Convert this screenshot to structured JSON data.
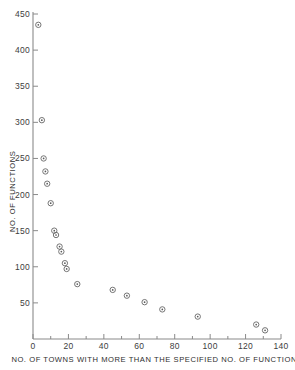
{
  "chart_data": {
    "type": "scatter",
    "title": "",
    "xlabel": "NO. OF TOWNS WITH MORE THAN THE SPECIFIED NO. OF FUNCTIONS",
    "ylabel": "NO. OF FUNCTIONS",
    "xlim": [
      0,
      140
    ],
    "ylim": [
      0,
      450
    ],
    "xticks": [
      0,
      20,
      40,
      60,
      80,
      100,
      120,
      140
    ],
    "yticks": [
      50,
      100,
      150,
      200,
      250,
      300,
      350,
      400,
      450
    ],
    "xticklabels": [
      "0",
      "20",
      "40",
      "60",
      "80",
      "100",
      "120",
      "140"
    ],
    "yticklabels": [
      "50",
      "100",
      "150",
      "200",
      "250",
      "300",
      "350",
      "400",
      "450"
    ],
    "xminorticks": [
      10,
      30,
      50,
      70,
      90,
      110,
      130
    ],
    "grid": false,
    "legend": null,
    "marker": "circle-with-center-dot",
    "marker_color": "#6e6e6e",
    "axis_color": "#8a8a8a",
    "spines": [
      "left",
      "bottom"
    ],
    "points": [
      {
        "x": 3,
        "y": 435
      },
      {
        "x": 5,
        "y": 303
      },
      {
        "x": 6,
        "y": 250
      },
      {
        "x": 7,
        "y": 232
      },
      {
        "x": 8,
        "y": 215
      },
      {
        "x": 10,
        "y": 188
      },
      {
        "x": 12,
        "y": 150
      },
      {
        "x": 13,
        "y": 144
      },
      {
        "x": 15,
        "y": 128
      },
      {
        "x": 16,
        "y": 121
      },
      {
        "x": 18,
        "y": 105
      },
      {
        "x": 19,
        "y": 97
      },
      {
        "x": 25,
        "y": 76
      },
      {
        "x": 45,
        "y": 68
      },
      {
        "x": 53,
        "y": 60
      },
      {
        "x": 63,
        "y": 51
      },
      {
        "x": 73,
        "y": 41
      },
      {
        "x": 93,
        "y": 31
      },
      {
        "x": 126,
        "y": 20
      },
      {
        "x": 131,
        "y": 12
      }
    ]
  }
}
